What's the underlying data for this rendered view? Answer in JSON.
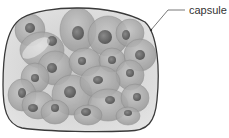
{
  "diagram": {
    "type": "biological-illustration",
    "labels": [
      {
        "text": "capsule",
        "target": "capsule-outline"
      }
    ],
    "colors": {
      "capsule_stroke": "#3a3a3a",
      "capsule_fill": "#d4d4d4",
      "cell_fill": "#a9a9a9",
      "cell_stroke": "#8c8c8c",
      "nucleus_fill": "#6e6e6e",
      "leader_line": "#555555",
      "label_text": "#333333"
    },
    "cells": [
      {
        "cx": 30,
        "cy": 30,
        "rx": 15,
        "ry": 16
      },
      {
        "cx": 42,
        "cy": 50,
        "rx": 22,
        "ry": 18
      },
      {
        "cx": 78,
        "cy": 30,
        "rx": 18,
        "ry": 22
      },
      {
        "cx": 108,
        "cy": 36,
        "rx": 20,
        "ry": 20
      },
      {
        "cx": 130,
        "cy": 33,
        "rx": 14,
        "ry": 14
      },
      {
        "cx": 140,
        "cy": 55,
        "rx": 16,
        "ry": 16
      },
      {
        "cx": 55,
        "cy": 68,
        "rx": 17,
        "ry": 17
      },
      {
        "cx": 85,
        "cy": 62,
        "rx": 16,
        "ry": 14
      },
      {
        "cx": 112,
        "cy": 60,
        "rx": 13,
        "ry": 12
      },
      {
        "cx": 130,
        "cy": 75,
        "rx": 14,
        "ry": 15
      },
      {
        "cx": 35,
        "cy": 78,
        "rx": 14,
        "ry": 15
      },
      {
        "cx": 22,
        "cy": 95,
        "rx": 14,
        "ry": 16
      },
      {
        "cx": 38,
        "cy": 105,
        "rx": 16,
        "ry": 14
      },
      {
        "cx": 72,
        "cy": 95,
        "rx": 20,
        "ry": 20
      },
      {
        "cx": 100,
        "cy": 82,
        "rx": 20,
        "ry": 16
      },
      {
        "cx": 108,
        "cy": 105,
        "rx": 20,
        "ry": 16
      },
      {
        "cx": 135,
        "cy": 98,
        "rx": 14,
        "ry": 14
      },
      {
        "cx": 55,
        "cy": 112,
        "rx": 14,
        "ry": 12
      },
      {
        "cx": 88,
        "cy": 115,
        "rx": 14,
        "ry": 10
      },
      {
        "cx": 128,
        "cy": 116,
        "rx": 12,
        "ry": 9
      }
    ],
    "nuclei": [
      {
        "cx": 30,
        "cy": 28,
        "rx": 5,
        "ry": 5
      },
      {
        "cx": 52,
        "cy": 41,
        "rx": 5,
        "ry": 5
      },
      {
        "cx": 78,
        "cy": 33,
        "rx": 6,
        "ry": 7
      },
      {
        "cx": 105,
        "cy": 37,
        "rx": 7,
        "ry": 7
      },
      {
        "cx": 126,
        "cy": 35,
        "rx": 4,
        "ry": 5
      },
      {
        "cx": 140,
        "cy": 55,
        "rx": 5,
        "ry": 5
      },
      {
        "cx": 52,
        "cy": 68,
        "rx": 5,
        "ry": 5
      },
      {
        "cx": 82,
        "cy": 61,
        "rx": 4,
        "ry": 4
      },
      {
        "cx": 112,
        "cy": 60,
        "rx": 4,
        "ry": 4
      },
      {
        "cx": 130,
        "cy": 73,
        "rx": 4,
        "ry": 4
      },
      {
        "cx": 35,
        "cy": 78,
        "rx": 4,
        "ry": 4
      },
      {
        "cx": 22,
        "cy": 93,
        "rx": 4,
        "ry": 5
      },
      {
        "cx": 33,
        "cy": 108,
        "rx": 5,
        "ry": 4
      },
      {
        "cx": 70,
        "cy": 92,
        "rx": 6,
        "ry": 6
      },
      {
        "cx": 98,
        "cy": 80,
        "rx": 5,
        "ry": 4
      },
      {
        "cx": 110,
        "cy": 100,
        "rx": 5,
        "ry": 4
      },
      {
        "cx": 137,
        "cy": 97,
        "rx": 4,
        "ry": 4
      },
      {
        "cx": 55,
        "cy": 108,
        "rx": 4,
        "ry": 4
      },
      {
        "cx": 86,
        "cy": 112,
        "rx": 5,
        "ry": 4
      },
      {
        "cx": 128,
        "cy": 113,
        "rx": 4,
        "ry": 3
      }
    ]
  }
}
